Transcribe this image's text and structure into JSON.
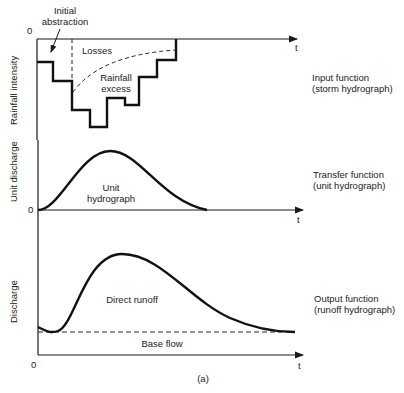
{
  "figure": {
    "caption": "(a)",
    "panels": [
      {
        "id": "input",
        "ylabel": "Rainfall intensity",
        "origin_label": "0",
        "xlabel": "t",
        "side_label_line1": "Input function",
        "side_label_line2": "(storm hydrograph)",
        "annotations": {
          "initial_abstraction_line1": "Initial",
          "initial_abstraction_line2": "abstraction",
          "losses": "Losses",
          "rainfall_excess_line1": "Rainfall",
          "rainfall_excess_line2": "excess"
        }
      },
      {
        "id": "transfer",
        "ylabel": "Unit discharge",
        "origin_label": "0",
        "xlabel": "t",
        "side_label_line1": "Transfer function",
        "side_label_line2": "(unit hydrograph)",
        "annotations": {
          "curve_line1": "Unit",
          "curve_line2": "hydrograph"
        }
      },
      {
        "id": "output",
        "ylabel": "Discharge",
        "origin_label": "0",
        "xlabel": "t",
        "side_label_line1": "Output function",
        "side_label_line2": "(runoff hydrograph)",
        "annotations": {
          "direct_runoff": "Direct runoff",
          "base_flow": "Base flow"
        }
      }
    ]
  }
}
